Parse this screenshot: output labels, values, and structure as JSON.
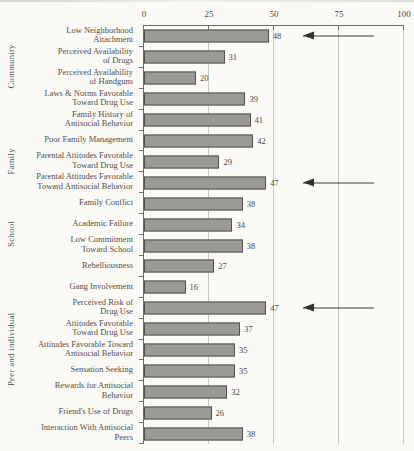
{
  "chart_data": {
    "type": "bar",
    "orientation": "horizontal",
    "title": "",
    "xlabel": "",
    "ylabel": "",
    "axis_position": "top",
    "xlim": [
      0,
      100
    ],
    "x_tick_labels": [
      "0",
      "25",
      "50",
      "75",
      "100"
    ],
    "grid": "vertical gridlines at 25, 50, 75 and 100",
    "legend": "none",
    "bar_color": "#9c9a96",
    "bar_border_color": "#52504c",
    "arrow_color": "#33312e",
    "value_labels_shown": true,
    "groups": [
      {
        "label": "Community",
        "items": [
          {
            "label": "Low Neighborhood Attachment",
            "lines": [
              "Low Neighborhood",
              "Attachment"
            ],
            "value": 48,
            "arrow": true
          },
          {
            "label": "Perceived Availability of Drugs",
            "lines": [
              "Perceived Availability",
              "of Drugs"
            ],
            "value": 31,
            "arrow": false
          },
          {
            "label": "Perceived Availability of Handguns",
            "lines": [
              "Perceived Availability",
              "of Handguns"
            ],
            "value": 20,
            "arrow": false
          },
          {
            "label": "Laws & Norms Favorable Toward Drug Use",
            "lines": [
              "Laws & Norms Favorable",
              "Toward Drug Use"
            ],
            "value": 39,
            "arrow": false
          }
        ]
      },
      {
        "label": "Family",
        "items": [
          {
            "label": "Family History of Antisocial Behavior",
            "lines": [
              "Family History of",
              "Antisocial Behavior"
            ],
            "value": 41,
            "arrow": false
          },
          {
            "label": "Poor Family Management",
            "lines": [
              "Poor Family Management"
            ],
            "value": 42,
            "arrow": false
          },
          {
            "label": "Parental Attitudes Favorable Toward Drug Use",
            "lines": [
              "Parental Attitudes Favorable",
              "Toward Drug Use"
            ],
            "value": 29,
            "arrow": false
          },
          {
            "label": "Parental Attitudes Favorable Toward Antisocial Behavior",
            "lines": [
              "Parental Attitudes Favorable",
              "Toward Antisocial Behavior"
            ],
            "value": 47,
            "arrow": true
          },
          {
            "label": "Family Conflict",
            "lines": [
              "Family Conflict"
            ],
            "value": 38,
            "arrow": false
          }
        ]
      },
      {
        "label": "School",
        "items": [
          {
            "label": "Academic Failure",
            "lines": [
              "Academic Failure"
            ],
            "value": 34,
            "arrow": false
          },
          {
            "label": "Low Commitment Toward School",
            "lines": [
              "Low Commitment",
              "Toward School"
            ],
            "value": 38,
            "arrow": false
          }
        ]
      },
      {
        "label": "Peer and individual",
        "items": [
          {
            "label": "Rebelliousness",
            "lines": [
              "Rebelliousness"
            ],
            "value": 27,
            "arrow": false
          },
          {
            "label": "Gang Involvement",
            "lines": [
              "Gang Involvement"
            ],
            "value": 16,
            "arrow": false
          },
          {
            "label": "Perceived Risk of Drug Use",
            "lines": [
              "Perceived Risk of",
              "Drug Use"
            ],
            "value": 47,
            "arrow": true
          },
          {
            "label": "Attitudes Favorable Toward Drug Use",
            "lines": [
              "Attitudes Favorable",
              "Toward Drug Use"
            ],
            "value": 37,
            "arrow": false
          },
          {
            "label": "Attitudes Favorable Toward Antisocial Behavior",
            "lines": [
              "Attitudes Favorable Toward",
              "Antisocial Behavior"
            ],
            "value": 35,
            "arrow": false
          },
          {
            "label": "Sensation Seeking",
            "lines": [
              "Sensation Seeking"
            ],
            "value": 35,
            "arrow": false
          },
          {
            "label": "Rewards for Antisocial Behavior",
            "lines": [
              "Rewards for Antisocial",
              "Behavior"
            ],
            "value": 32,
            "arrow": false
          },
          {
            "label": "Friend's Use of Drugs",
            "lines": [
              "Friend's Use of Drugs"
            ],
            "value": 26,
            "arrow": false
          },
          {
            "label": "Interaction With Antisocial Peers",
            "lines": [
              "Interaction With Antisocial",
              "Peers"
            ],
            "value": 38,
            "arrow": false
          }
        ]
      }
    ]
  }
}
